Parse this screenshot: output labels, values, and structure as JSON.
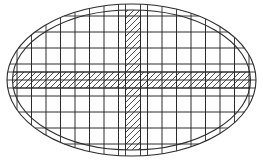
{
  "canvas": {
    "width": 263,
    "height": 163,
    "background": "#ffffff"
  },
  "diagram": {
    "type": "elliptical grid with hatched cross",
    "stroke_color": "#2a2a2a",
    "hatch_color": "#3a3a3a",
    "outer_ellipse": {
      "cx": 131.5,
      "cy": 80,
      "rx": 124.5,
      "ry": 76
    },
    "inner_ellipse": {
      "cx": 131.5,
      "cy": 80,
      "rx": 119,
      "ry": 70
    },
    "vertical_lines": [
      17,
      31.5,
      46,
      60.5,
      75,
      89.5,
      104,
      118.5,
      125.5,
      140.5,
      147.5,
      162,
      176.5,
      191,
      205.5,
      220,
      234.5,
      249
    ],
    "horizontal_lines": [
      16,
      32,
      48,
      64,
      72,
      80,
      88,
      96,
      112,
      128,
      144
    ],
    "hatched_bands": [
      {
        "name": "horizontal-hatched-band",
        "orientation": "horizontal",
        "x": 0,
        "y": 72,
        "width": 263,
        "height": 16
      },
      {
        "name": "vertical-hatched-band",
        "orientation": "vertical",
        "x": 125.5,
        "y": 0,
        "width": 15,
        "height": 163
      }
    ],
    "hatch_spacing": 6
  }
}
